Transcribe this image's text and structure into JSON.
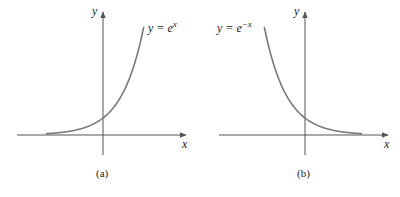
{
  "chart_data": [
    {
      "type": "line",
      "panel": "(a)",
      "title": "",
      "caption": "(a)",
      "xlabel": "x",
      "ylabel": "y",
      "annotation": "y = e^x",
      "function": "e^x",
      "grid": false,
      "xlim": [
        -2.6,
        1.85
      ],
      "ylim": [
        0,
        6.4
      ],
      "series": [
        {
          "name": "y = e^x",
          "x": [
            -2.6,
            -2.0,
            -1.5,
            -1.0,
            -0.5,
            0,
            0.5,
            1.0,
            1.5,
            1.85
          ],
          "values": [
            0.07,
            0.14,
            0.22,
            0.37,
            0.61,
            1.0,
            1.65,
            2.72,
            4.48,
            6.36
          ]
        }
      ]
    },
    {
      "type": "line",
      "panel": "(b)",
      "title": "",
      "caption": "(b)",
      "xlabel": "x",
      "ylabel": "y",
      "annotation": "y = e^-x",
      "function": "e^-x",
      "grid": false,
      "xlim": [
        -1.85,
        2.6
      ],
      "ylim": [
        0,
        6.4
      ],
      "series": [
        {
          "name": "y = e^-x",
          "x": [
            -1.85,
            -1.5,
            -1.0,
            -0.5,
            0,
            0.5,
            1.0,
            1.5,
            2.0,
            2.6
          ],
          "values": [
            6.36,
            4.48,
            2.72,
            1.65,
            1.0,
            0.61,
            0.37,
            0.22,
            0.14,
            0.07
          ]
        }
      ]
    }
  ],
  "panels": {
    "a": {
      "caption": "(a)",
      "x_label": "x",
      "y_label": "y",
      "eq_lhs": "y = e",
      "eq_exp": "x"
    },
    "b": {
      "caption": "(b)",
      "x_label": "x",
      "y_label": "y",
      "eq_lhs": "y = e",
      "eq_exp": "−x"
    }
  },
  "colors": {
    "axis": "#555555",
    "curve": "#7a7a7a",
    "text": "#222222"
  }
}
